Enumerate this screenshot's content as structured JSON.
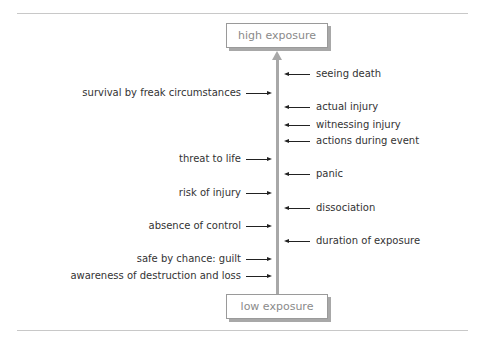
{
  "diagram": {
    "top_label": "high exposure",
    "bottom_label": "low exposure",
    "colors": {
      "axis": "#a8a8a8",
      "box_border": "#9a9a9a",
      "box_text": "#8a8a8a",
      "label_text": "#333333",
      "rule": "#c8c8c8"
    },
    "left_factors": [
      {
        "label": "survival by freak circumstances",
        "y": 93
      },
      {
        "label": "threat to life",
        "y": 159
      },
      {
        "label": "risk of injury",
        "y": 193
      },
      {
        "label": "absence of control",
        "y": 226
      },
      {
        "label": "safe by chance: guilt",
        "y": 259
      },
      {
        "label": "awareness of destruction and loss",
        "y": 276
      }
    ],
    "right_factors": [
      {
        "label": "seeing death",
        "y": 74
      },
      {
        "label": "actual injury",
        "y": 107
      },
      {
        "label": "witnessing injury",
        "y": 125
      },
      {
        "label": "actions during event",
        "y": 141
      },
      {
        "label": "panic",
        "y": 174
      },
      {
        "label": "dissociation",
        "y": 208
      },
      {
        "label": "duration of exposure",
        "y": 241
      }
    ]
  }
}
